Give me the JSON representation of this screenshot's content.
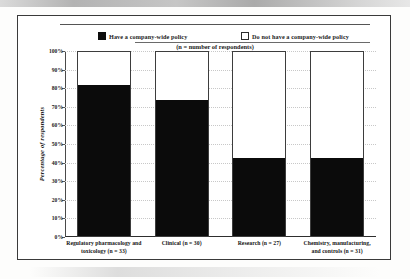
{
  "chart_data": {
    "type": "bar",
    "subtype": "stacked-100-percent",
    "title": "",
    "subtitle": "(n = number of respondents)",
    "xlabel": "",
    "ylabel": "Percentage of respondents",
    "ylim": [
      0,
      100
    ],
    "ytick_labels": [
      "100%",
      "90%",
      "80%",
      "70%",
      "60%",
      "50%",
      "40%",
      "30%",
      "20%",
      "10%",
      "0%"
    ],
    "ytick_values": [
      100,
      90,
      80,
      70,
      60,
      50,
      40,
      30,
      20,
      10,
      0
    ],
    "grid": true,
    "legend_position": "top",
    "categories": [
      "Regulatory pharmacology and toxicology (n = 33)",
      "Clinical (n = 30)",
      "Research (n = 27)",
      "Chemistry, manufacturing, and controls (n = 31)"
    ],
    "category_lines": [
      [
        "Regulatory pharmacology and",
        "toxicology (n = 33)"
      ],
      [
        "Clinical (n = 30)"
      ],
      [
        "Research (n = 27)"
      ],
      [
        "Chemistry, manufacturing,",
        "and controls (n = 31)"
      ]
    ],
    "series": [
      {
        "name": "Have a company-wide policy",
        "color": "#0b0b0b",
        "marker": "filled-square",
        "values": [
          81,
          73,
          42,
          42
        ]
      },
      {
        "name": "Do not have a company-wide policy",
        "color": "#ffffff",
        "marker": "hollow-square",
        "values": [
          19,
          27,
          58,
          58
        ]
      }
    ]
  },
  "legend": {
    "entries": [
      {
        "label": "Have a company-wide policy"
      },
      {
        "label": "Do not have a company-wide policy"
      }
    ],
    "note": "(n = number of respondents)"
  },
  "axes": {
    "y_title": "Percentage of respondents"
  },
  "colors": {
    "have_policy": "#0b0b0b",
    "no_policy": "#ffffff",
    "frame": "#3a3a3a",
    "gridline": "#c8c8c8"
  }
}
